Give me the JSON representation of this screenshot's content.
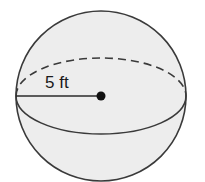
{
  "figure": {
    "shape": "sphere",
    "radius_label": "5 ft",
    "colors": {
      "fill": "#ededed",
      "stroke": "#3a3a3a",
      "background": "#ffffff"
    }
  }
}
